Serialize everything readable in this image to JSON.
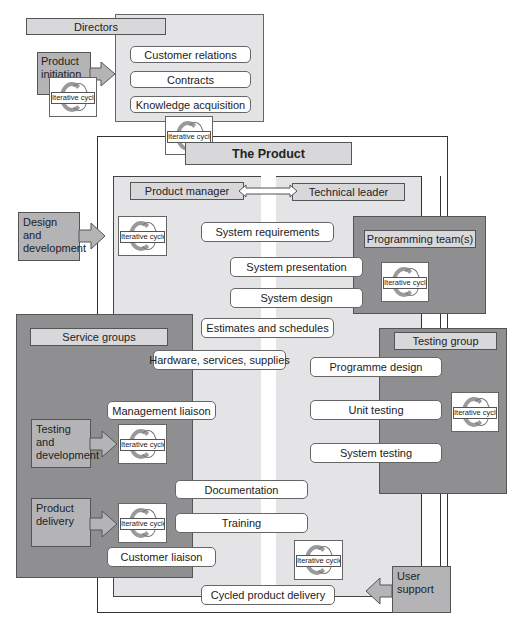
{
  "directors": {
    "title": "Directors",
    "items": [
      "Customer relations",
      "Contracts",
      "Knowledge acquisition"
    ]
  },
  "inputs": {
    "product_initiation": "Product initiation",
    "design_development": "Design and development",
    "testing_development": "Testing and development",
    "product_delivery": "Product delivery",
    "user_support": "User support"
  },
  "cycle_label": "Iterative cycle",
  "product": {
    "title": "The Product",
    "product_manager": "Product manager",
    "technical_leader": "Technical leader",
    "activities": [
      "System requirements",
      "System presentation",
      "System design",
      "Estimates and schedules",
      "Hardware, services, supplies",
      "Management liaison",
      "Documentation",
      "Training",
      "Customer liaison",
      "Cycled product delivery"
    ]
  },
  "programming_team": {
    "title": "Programming team(s)"
  },
  "testing_group": {
    "title": "Testing group",
    "items": [
      "Programme design",
      "Unit testing",
      "System testing"
    ]
  },
  "service_groups": {
    "title": "Service groups"
  },
  "colors": {
    "light_panel": "#e4e4e6",
    "dark_panel": "#8f8f91",
    "input_box": "#b4b4b6",
    "label_box": "#d8d8da"
  }
}
